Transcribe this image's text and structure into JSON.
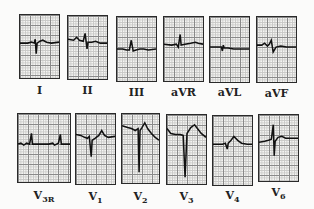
{
  "figure": {
    "rows": [
      {
        "leads": [
          {
            "label": "I",
            "sub": ""
          },
          {
            "label": "II",
            "sub": ""
          },
          {
            "label": "III",
            "sub": ""
          },
          {
            "label": "aVR",
            "sub": ""
          },
          {
            "label": "aVL",
            "sub": ""
          },
          {
            "label": "aVF",
            "sub": ""
          }
        ]
      },
      {
        "leads": [
          {
            "label": "V",
            "sub": "3R"
          },
          {
            "label": "V",
            "sub": "1"
          },
          {
            "label": "V",
            "sub": "2"
          },
          {
            "label": "V",
            "sub": "3"
          },
          {
            "label": "V",
            "sub": "4"
          },
          {
            "label": "V",
            "sub": "6"
          }
        ]
      }
    ]
  }
}
